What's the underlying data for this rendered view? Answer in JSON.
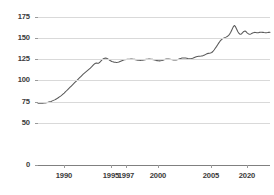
{
  "chart_data": {
    "type": "line",
    "title": "",
    "subtitle": "",
    "xlabel": "",
    "ylabel": "",
    "ylim": [
      0,
      175
    ],
    "grid": true,
    "legend": "none",
    "y_ticks": [
      175,
      150,
      125,
      100,
      75,
      50,
      0
    ],
    "y_tick_labels": [
      "175",
      "150",
      "125",
      "100",
      "75",
      "50",
      "0"
    ],
    "x_tick_labels": [
      "1990",
      "1995",
      "1997",
      "2000",
      "2005",
      "2020"
    ],
    "x_tick_positions_px": [
      64,
      111,
      126,
      158,
      211,
      247
    ],
    "series": [
      {
        "name": "series-1",
        "color": "#595959",
        "values": [
          73,
          73,
          73,
          73,
          73,
          73.2,
          73.4,
          73.6,
          74,
          74.4,
          74.8,
          75.2,
          75.8,
          76.4,
          77,
          77.8,
          78.6,
          79.5,
          80.5,
          81.5,
          82.6,
          83.8,
          85,
          86.4,
          87.8,
          89.2,
          90.6,
          92,
          93.4,
          94.8,
          96.2,
          97.6,
          99,
          100.4,
          101.8,
          103.2,
          104.6,
          106,
          107.4,
          108.6,
          109.8,
          111,
          112.2,
          113.4,
          114.6,
          116,
          117.5,
          119,
          120,
          120.6,
          120.2,
          120.4,
          121.5,
          123,
          124.5,
          125.6,
          126.2,
          126.4,
          126,
          125.2,
          124.2,
          123.2,
          122.4,
          122,
          121.6,
          121.4,
          121.2,
          121.4,
          121.8,
          122.4,
          123,
          123.6,
          124.2,
          124.6,
          124.8,
          124.9,
          125,
          125.1,
          125.2,
          125.2,
          125.1,
          124.9,
          124.6,
          124.3,
          124,
          123.8,
          123.7,
          123.8,
          124,
          124.3,
          124.6,
          124.9,
          125.1,
          125.2,
          125.2,
          125.1,
          124.9,
          124.6,
          124.2,
          123.8,
          123.4,
          123.2,
          123.1,
          123.2,
          123.5,
          124,
          124.5,
          125,
          125.3,
          125.4,
          125.3,
          125.1,
          124.8,
          124.5,
          124.3,
          124.2,
          124.3,
          124.6,
          125,
          125.5,
          126,
          126.4,
          126.6,
          126.6,
          126.4,
          126.1,
          125.8,
          125.6,
          125.6,
          125.8,
          126.2,
          126.8,
          127.4,
          128,
          128.4,
          128.6,
          128.7,
          128.8,
          129,
          129.4,
          130,
          130.8,
          131.6,
          132,
          132.2,
          132.4,
          133,
          134.2,
          136,
          138,
          140,
          142.2,
          144.4,
          146.4,
          148,
          149.2,
          150,
          150.6,
          151.2,
          152,
          153,
          154.5,
          157,
          160,
          163,
          165,
          163.5,
          160.5,
          157.5,
          155.5,
          154.5,
          155,
          156.5,
          158,
          158.4,
          157.5,
          156,
          155,
          154.6,
          155,
          155.8,
          156.5,
          156.8,
          156.6,
          156.4,
          156.5,
          156.8,
          157,
          157,
          156.8,
          156.6,
          156.5,
          156.5,
          156.6,
          156.8,
          157
        ]
      }
    ]
  }
}
